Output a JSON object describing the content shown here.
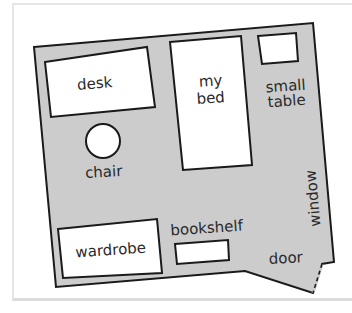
{
  "diagram": {
    "type": "floor-plan",
    "colors": {
      "floor": "#cccccc",
      "furniture": "#ffffff",
      "outline": "#1a1a1a",
      "text": "#2a2a2a"
    },
    "labels": {
      "desk": "desk",
      "bed_line1": "my",
      "bed_line2": "bed",
      "small_table_line1": "small",
      "small_table_line2": "table",
      "chair": "chair",
      "wardrobe": "wardrobe",
      "bookshelf": "bookshelf",
      "door": "door",
      "window": "window"
    }
  }
}
